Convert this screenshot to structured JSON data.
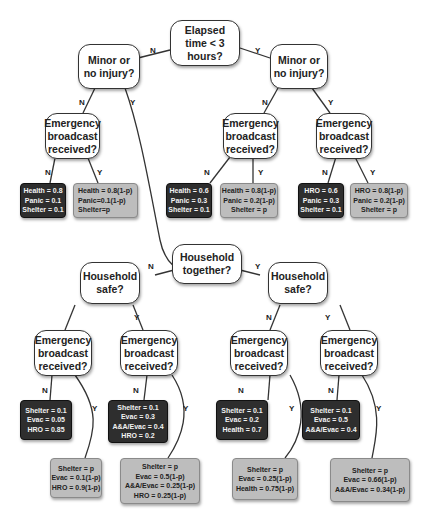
{
  "diagram": {
    "type": "decision-tree",
    "root": {
      "label": "Elapsed\ntime < 3\nhours?"
    },
    "branch_labels": {
      "no": "N",
      "yes": "Y"
    },
    "nodes": {
      "minor_left": "Minor or\nno injury?",
      "minor_right": "Minor or\nno injury?",
      "eb_l1": "Emergency\nbroadcast\nreceived?",
      "eb_r1": "Emergency\nbroadcast\nreceived?",
      "eb_r2": "Emergency\nbroadcast\nreceived?",
      "hh_together": "Household\ntogether?",
      "hh_safe_left": "Household\nsafe?",
      "hh_safe_right": "Household\nsafe?",
      "eb_b1": "Emergency\nbroadcast\nreceived?",
      "eb_b2": "Emergency\nbroadcast\nreceived?",
      "eb_b3": "Emergency\nbroadcast\nreceived?",
      "eb_b4": "Emergency\nbroadcast\nreceived?"
    },
    "leaves": {
      "l1": "Health = 0.8\nPanic = 0.1\nShelter = 0.1",
      "l2": "Health = 0.8(1-p)\nPanic=0.1(1-p)\nShelter=p",
      "l3": "Health = 0.6\nPanic = 0.3\nShelter = 0.1",
      "l4": "Health = 0.8(1-p)\nPanic = 0.2(1-p)\nShelter = p",
      "l5": "HRO = 0.6\nPanic = 0.3\nShelter = 0.1",
      "l6": "HRO = 0.8(1-p)\nPanic = 0.2(1-p)\nShelter = p",
      "b1n": "Shelter = 0.1\nEvac = 0.05\nHRO = 0.85",
      "b2n": "Shelter = 0.1\nEvac = 0.3\nA&A/Evac = 0.4\nHRO = 0.2",
      "b3n": "Shelter = 0.1\nEvac = 0.2\nHealth = 0.7",
      "b4n": "Shelter = 0.1\nEvac = 0.5\nA&A/Evac = 0.4",
      "b1y": "Shelter = p\nEvac = 0.1(1-p)\nHRO = 0.9(1-p)",
      "b2y": "Shelter = p\nEvac = 0.5(1-p)\nA&A/Evac = 0.25(1-p)\nHRO = 0.25(1-p)",
      "b3y": "Shelter = p\nEvac = 0.25(1-p)\nHealth = 0.75(1-p)",
      "b4y": "Shelter = p\nEvac = 0.66(1-p)\nA&A/Evac = 0.34(1-p)"
    }
  }
}
